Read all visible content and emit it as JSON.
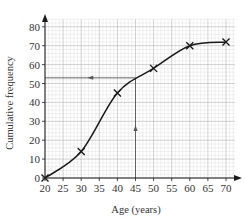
{
  "chart_data": {
    "type": "line",
    "title": "",
    "xlabel": "Age (years)",
    "ylabel": "Cumulative frequency",
    "xlim": [
      20,
      72
    ],
    "ylim": [
      0,
      85
    ],
    "x_ticks": [
      20,
      25,
      30,
      35,
      40,
      45,
      50,
      55,
      60,
      65,
      70
    ],
    "y_ticks": [
      0,
      10,
      20,
      30,
      40,
      50,
      60,
      70,
      80
    ],
    "grid": true,
    "series": [
      {
        "name": "Cumulative frequency curve",
        "marker": "x",
        "points": [
          {
            "x": 20,
            "y": 0
          },
          {
            "x": 30,
            "y": 14
          },
          {
            "x": 40,
            "y": 45
          },
          {
            "x": 50,
            "y": 58
          },
          {
            "x": 60,
            "y": 70
          },
          {
            "x": 70,
            "y": 72
          }
        ]
      }
    ],
    "annotations": [
      {
        "type": "vertical-reading-line",
        "x": 45,
        "from_y": 0,
        "to_y": 53,
        "arrow": "up"
      },
      {
        "type": "horizontal-reading-line",
        "y": 53,
        "from_x": 45,
        "to_x": 20,
        "arrow": "left"
      }
    ]
  },
  "colors": {
    "curve": "#1a1a1a",
    "grid_minor": "#d9d9d9",
    "grid_major": "#b3b3b3",
    "axis": "#1a1a1a",
    "reading_line": "#555555"
  }
}
